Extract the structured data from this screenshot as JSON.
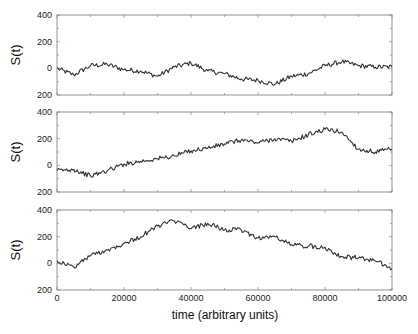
{
  "chart_data": [
    {
      "type": "line",
      "title": "",
      "xlabel": "",
      "ylabel": "S(t)",
      "ylim": [
        -200,
        400
      ],
      "xlim": [
        0,
        100000
      ],
      "yticks": [
        400,
        200,
        0,
        -200
      ],
      "ytick_labels": [
        "400",
        "200",
        "0",
        "200"
      ],
      "grid": false,
      "x": [
        0,
        5000,
        10000,
        15000,
        20000,
        25000,
        30000,
        35000,
        40000,
        45000,
        50000,
        55000,
        60000,
        65000,
        70000,
        75000,
        80000,
        85000,
        90000,
        95000,
        100000
      ],
      "series": [
        {
          "name": "S(t)",
          "values": [
            0,
            -50,
            20,
            30,
            -10,
            -20,
            -60,
            10,
            40,
            -20,
            -40,
            -80,
            -90,
            -120,
            -60,
            -40,
            20,
            50,
            20,
            10,
            10
          ]
        }
      ]
    },
    {
      "type": "line",
      "title": "",
      "xlabel": "",
      "ylabel": "S(t)",
      "ylim": [
        -200,
        400
      ],
      "xlim": [
        0,
        100000
      ],
      "yticks": [
        400,
        200,
        0,
        -200
      ],
      "ytick_labels": [
        "400",
        "200",
        "0",
        "200"
      ],
      "grid": false,
      "x": [
        0,
        5000,
        10000,
        15000,
        20000,
        25000,
        30000,
        35000,
        40000,
        45000,
        50000,
        55000,
        60000,
        65000,
        70000,
        75000,
        80000,
        85000,
        90000,
        95000,
        100000
      ],
      "series": [
        {
          "name": "S(t)",
          "values": [
            -40,
            -30,
            -80,
            -40,
            10,
            30,
            50,
            70,
            110,
            130,
            160,
            190,
            170,
            200,
            180,
            230,
            270,
            250,
            120,
            100,
            120
          ]
        }
      ]
    },
    {
      "type": "line",
      "title": "",
      "xlabel": "time (arbitrary units)",
      "ylabel": "S(t)",
      "ylim": [
        -200,
        400
      ],
      "xlim": [
        0,
        100000
      ],
      "yticks": [
        400,
        200,
        0,
        -200
      ],
      "ytick_labels": [
        "400",
        "200",
        "0",
        "200"
      ],
      "xticks": [
        0,
        20000,
        40000,
        60000,
        80000,
        100000
      ],
      "xtick_labels": [
        "0",
        "20000",
        "40000",
        "60000",
        "80000",
        "100000"
      ],
      "grid": false,
      "x": [
        0,
        5000,
        10000,
        15000,
        20000,
        25000,
        30000,
        35000,
        40000,
        45000,
        50000,
        55000,
        60000,
        65000,
        70000,
        75000,
        80000,
        85000,
        90000,
        95000,
        100000
      ],
      "series": [
        {
          "name": "S(t)",
          "values": [
            20,
            -30,
            60,
            100,
            150,
            200,
            280,
            320,
            260,
            300,
            250,
            250,
            190,
            200,
            140,
            130,
            120,
            50,
            40,
            20,
            -40
          ]
        }
      ]
    }
  ],
  "labels": {
    "ylabel": "S(t)",
    "xlabel": "time (arbitrary units)"
  },
  "colors": {
    "line": "#333333",
    "frame": "#777777"
  }
}
